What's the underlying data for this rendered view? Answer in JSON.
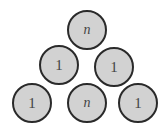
{
  "diagram": {
    "type": "triangle-of-circles",
    "rows": [
      {
        "nodes": [
          {
            "label": "n",
            "italic": true
          }
        ]
      },
      {
        "nodes": [
          {
            "label": "1",
            "italic": false
          },
          {
            "label": "1",
            "italic": false
          }
        ]
      },
      {
        "nodes": [
          {
            "label": "1",
            "italic": false
          },
          {
            "label": "n",
            "italic": true
          },
          {
            "label": "1",
            "italic": false
          }
        ]
      }
    ],
    "colors": {
      "fill": "#d2d2d2",
      "stroke": "#2a2a2a",
      "text": "#444444"
    }
  }
}
